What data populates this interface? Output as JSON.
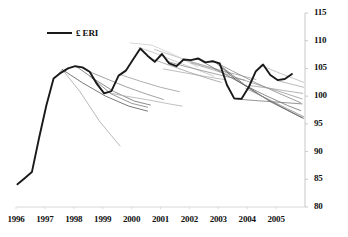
{
  "chart_data": {
    "type": "line",
    "title": "",
    "xlabel": "",
    "ylabel": "",
    "xlim": [
      1996.0,
      2006.0
    ],
    "ylim": [
      80,
      115
    ],
    "yticks": [
      80,
      85,
      90,
      95,
      100,
      105,
      110,
      115
    ],
    "xticks": [
      1996,
      1997,
      1998,
      1999,
      2000,
      2001,
      2002,
      2003,
      2004,
      2005
    ],
    "grid": false,
    "legend": {
      "position": "top-left",
      "entries": [
        {
          "label": "£ ERI",
          "color": "#1a1a1a",
          "width": 2
        }
      ]
    },
    "axis": {
      "right_spine": true,
      "left_spine": false,
      "bottom_spine": true,
      "bottom_spine_color": "#d8d8d8",
      "right_spine_color": "#c8c8c8"
    },
    "series": [
      {
        "name": "£ ERI",
        "kind": "actual",
        "color": "#1a1a1a",
        "width": 1.9,
        "x": [
          1996.05,
          1996.3,
          1996.55,
          1996.8,
          1997.05,
          1997.3,
          1997.55,
          1997.8,
          1998.05,
          1998.3,
          1998.55,
          1998.8,
          1999.05,
          1999.3,
          1999.55,
          1999.8,
          2000.05,
          2000.3,
          2000.55,
          2000.8,
          2001.05,
          2001.3,
          2001.55,
          2001.8,
          2002.05,
          2002.3,
          2002.55,
          2002.8,
          2003.05,
          2003.3,
          2003.55,
          2003.8,
          2004.05,
          2004.3,
          2004.55,
          2004.8,
          2005.05,
          2005.3,
          2005.55
        ],
        "y": [
          84.1,
          85.2,
          86.3,
          92.5,
          98.3,
          103.2,
          104.2,
          105.0,
          105.4,
          105.2,
          104.4,
          102.2,
          100.5,
          100.9,
          103.7,
          104.6,
          106.6,
          108.6,
          107.3,
          106.2,
          107.6,
          105.9,
          105.4,
          106.6,
          106.5,
          106.8,
          106.1,
          106.3,
          105.9,
          102.0,
          99.6,
          99.5,
          101.6,
          104.5,
          105.7,
          103.8,
          102.9,
          103.1,
          104.0
        ]
      },
      {
        "name": "forecast vintage 1997H2",
        "kind": "forecast",
        "color": "#9a9a9a",
        "width": 0.7,
        "x": [
          1997.35,
          1997.6,
          1998.2,
          1998.9,
          1999.6
        ],
        "y": [
          103.3,
          104.8,
          100.9,
          95.4,
          91.0
        ]
      },
      {
        "name": "forecast vintage 1997H2-b",
        "kind": "forecast",
        "color": "#555555",
        "width": 0.8,
        "x": [
          1997.6,
          1998.3,
          1999.1,
          1999.9,
          2000.55
        ],
        "y": [
          104.8,
          102.4,
          100.0,
          98.2,
          97.3
        ]
      },
      {
        "name": "forecast vintage 1998H1",
        "kind": "forecast",
        "color": "#6d6d6d",
        "width": 0.8,
        "x": [
          1998.1,
          1998.7,
          1999.4,
          2000.1,
          2000.65
        ],
        "y": [
          105.3,
          103.1,
          100.8,
          99.1,
          98.4
        ]
      },
      {
        "name": "forecast vintage 1998H2",
        "kind": "forecast",
        "color": "#8a8a8a",
        "width": 0.8,
        "x": [
          1998.45,
          1999.1,
          1999.8,
          2000.5,
          2001.1
        ],
        "y": [
          104.6,
          103.2,
          101.7,
          100.4,
          99.4
        ]
      },
      {
        "name": "forecast vintage 1999H1",
        "kind": "forecast",
        "color": "#b0b0b0",
        "width": 0.8,
        "x": [
          1999.1,
          1999.8,
          2000.6,
          2001.3,
          2001.75
        ],
        "y": [
          100.7,
          100.0,
          99.3,
          98.6,
          98.2
        ]
      },
      {
        "name": "forecast vintage 1999H2",
        "kind": "forecast",
        "color": "#9a9a9a",
        "width": 0.8,
        "x": [
          1999.6,
          2000.3,
          2001.0,
          2001.65
        ],
        "y": [
          103.9,
          102.7,
          101.6,
          100.8
        ]
      },
      {
        "name": "forecast vintage 2000H1",
        "kind": "forecast",
        "color": "#c0c0c0",
        "width": 0.8,
        "x": [
          2000.25,
          2000.9,
          2001.6,
          2002.3,
          2002.85
        ],
        "y": [
          108.8,
          107.6,
          106.1,
          104.7,
          103.6
        ]
      },
      {
        "name": "forecast vintage 2000H2",
        "kind": "forecast",
        "color": "#b5b5b5",
        "width": 0.8,
        "x": [
          2000.8,
          2001.5,
          2002.2,
          2002.9,
          2003.4
        ],
        "y": [
          108.4,
          107.2,
          106.0,
          104.9,
          104.0
        ]
      },
      {
        "name": "forecast vintage 2001H1",
        "kind": "forecast",
        "color": "#8f8f8f",
        "width": 0.8,
        "x": [
          2001.2,
          2001.9,
          2002.6,
          2003.3,
          2003.9
        ],
        "y": [
          106.3,
          105.3,
          104.4,
          103.5,
          102.9
        ]
      },
      {
        "name": "forecast vintage 2001H2",
        "kind": "forecast",
        "color": "#a5a5a5",
        "width": 0.8,
        "x": [
          2001.75,
          2002.45,
          2003.1,
          2003.8,
          2004.3
        ],
        "y": [
          106.6,
          105.6,
          104.6,
          103.7,
          103.0
        ]
      },
      {
        "name": "forecast vintage 2002H1",
        "kind": "forecast",
        "color": "#707070",
        "width": 0.8,
        "x": [
          2002.3,
          2003.0,
          2003.8,
          2004.6,
          2005.4,
          2005.85
        ],
        "y": [
          106.7,
          104.6,
          102.3,
          100.2,
          98.3,
          97.4
        ]
      },
      {
        "name": "forecast vintage 2002H2",
        "kind": "forecast",
        "color": "#868686",
        "width": 0.8,
        "x": [
          2002.8,
          2003.5,
          2004.3,
          2005.1,
          2005.85
        ],
        "y": [
          106.4,
          104.5,
          102.4,
          100.5,
          98.8
        ]
      },
      {
        "name": "forecast vintage 2003H1",
        "kind": "forecast",
        "color": "#5e5e5e",
        "width": 0.9,
        "x": [
          2002.95,
          2003.6,
          2004.4,
          2005.2,
          2005.9
        ],
        "y": [
          105.9,
          103.0,
          100.3,
          98.0,
          96.1
        ]
      },
      {
        "name": "forecast vintage 2003H2",
        "kind": "forecast",
        "color": "#7a7a7a",
        "width": 0.8,
        "x": [
          2003.55,
          2004.3,
          2005.1,
          2005.9
        ],
        "y": [
          99.5,
          99.2,
          98.9,
          98.6
        ]
      },
      {
        "name": "forecast vintage 2004H1",
        "kind": "forecast",
        "color": "#9f9f9f",
        "width": 0.8,
        "x": [
          2004.1,
          2004.8,
          2005.4,
          2005.92
        ],
        "y": [
          101.9,
          101.4,
          100.9,
          100.5
        ]
      },
      {
        "name": "forecast vintage 2004H2",
        "kind": "forecast",
        "color": "#b8b8b8",
        "width": 0.8,
        "x": [
          2004.45,
          2005.1,
          2005.6,
          2005.95
        ],
        "y": [
          105.6,
          104.2,
          103.2,
          102.5
        ]
      },
      {
        "name": "forecast vintage 2005H1",
        "kind": "forecast",
        "color": "#a8a8a8",
        "width": 0.8,
        "x": [
          2005.05,
          2005.5,
          2005.95
        ],
        "y": [
          102.8,
          102.2,
          101.6
        ]
      },
      {
        "name": "forecast vintage 2000H1-flat",
        "kind": "forecast",
        "color": "#cfcfcf",
        "width": 0.8,
        "x": [
          1999.95,
          2000.7,
          2001.5,
          2002.3
        ],
        "y": [
          109.6,
          109.2,
          107.4,
          105.2
        ]
      },
      {
        "name": "forecast vintage 1998-low",
        "kind": "forecast",
        "color": "#7e7e7e",
        "width": 0.8,
        "x": [
          1998.55,
          1999.3,
          2000.0,
          2000.55
        ],
        "y": [
          103.6,
          100.4,
          98.7,
          98.0
        ]
      },
      {
        "name": "forecast vintage 2003-deep",
        "kind": "forecast",
        "color": "#6a6a6a",
        "width": 0.8,
        "x": [
          2003.05,
          2003.9,
          2004.8,
          2005.6,
          2005.95
        ],
        "y": [
          105.6,
          102.1,
          99.0,
          96.9,
          96.0
        ]
      },
      {
        "name": "forecast vintage 2002-mid",
        "kind": "forecast",
        "color": "#989898",
        "width": 0.8,
        "x": [
          2002.05,
          2002.8,
          2003.6,
          2004.4,
          2005.2,
          2005.9
        ],
        "y": [
          106.0,
          104.8,
          103.4,
          102.0,
          100.7,
          99.5
        ]
      },
      {
        "name": "forecast vintage 2001-low",
        "kind": "forecast",
        "color": "#adadad",
        "width": 0.8,
        "x": [
          2001.1,
          2001.85,
          2002.6,
          2003.2
        ],
        "y": [
          104.9,
          104.2,
          103.5,
          103.0
        ]
      },
      {
        "name": "forecast vintage 2004-steep",
        "kind": "forecast",
        "color": "#8c8c8c",
        "width": 0.8,
        "x": [
          2003.95,
          2004.7,
          2005.4,
          2005.95
        ],
        "y": [
          101.4,
          99.5,
          97.7,
          96.3
        ]
      },
      {
        "name": "forecast vintage 2000-mid",
        "kind": "forecast",
        "color": "#a0a0a0",
        "width": 0.8,
        "x": [
          2000.6,
          2001.3,
          2002.0,
          2002.7,
          2003.1
        ],
        "y": [
          106.9,
          105.6,
          104.3,
          103.1,
          102.5
        ]
      }
    ]
  }
}
